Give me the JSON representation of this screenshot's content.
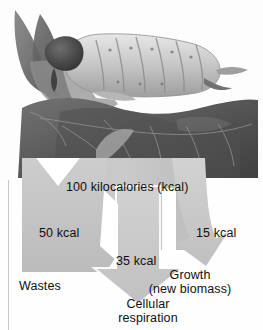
{
  "figure": {
    "type": "energy-budget-diagram",
    "photo": {
      "caption_alt": "grayscale photograph of a caterpillar feeding on a leaf",
      "organism": "caterpillar",
      "substrate": "leaf"
    },
    "input": {
      "label": "100 kilocalories (kcal)",
      "value": 100,
      "unit": "kcal"
    },
    "branches": [
      {
        "id": "wastes",
        "amount_label": "50 kcal",
        "value": 50,
        "unit": "kcal",
        "title": "Wastes",
        "subtitle": ""
      },
      {
        "id": "cellular-respiration",
        "amount_label": "35 kcal",
        "value": 35,
        "unit": "kcal",
        "title": "Cellular",
        "subtitle": "respiration"
      },
      {
        "id": "growth",
        "amount_label": "15 kcal",
        "value": 15,
        "unit": "kcal",
        "title": "Growth",
        "subtitle": "(new biomass)"
      }
    ],
    "colors": {
      "arrow_fill": "#c3c3c3",
      "arrow_fill_light": "#cfcfcf",
      "arrow_edge": "#9a9a9a",
      "text": "#101010",
      "background": "#ffffff",
      "rule": "#c9c9c9"
    }
  }
}
